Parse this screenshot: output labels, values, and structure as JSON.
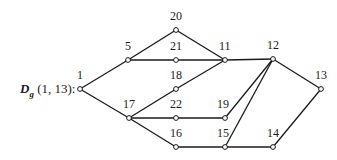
{
  "title": {
    "graph_symbol": "D",
    "subscript": "g",
    "args": "(1, 13):"
  },
  "graph": {
    "nodes": [
      {
        "id": "1",
        "x": 80,
        "y": 89,
        "lx": 77,
        "ly": 79
      },
      {
        "id": "5",
        "x": 128,
        "y": 60,
        "lx": 125,
        "ly": 50
      },
      {
        "id": "20",
        "x": 176,
        "y": 30,
        "lx": 170,
        "ly": 20
      },
      {
        "id": "21",
        "x": 176,
        "y": 60,
        "lx": 170,
        "ly": 50
      },
      {
        "id": "11",
        "x": 225,
        "y": 60,
        "lx": 219,
        "ly": 50
      },
      {
        "id": "18",
        "x": 176,
        "y": 89,
        "lx": 170,
        "ly": 79
      },
      {
        "id": "12",
        "x": 273,
        "y": 59,
        "lx": 267,
        "ly": 49
      },
      {
        "id": "13",
        "x": 321,
        "y": 89,
        "lx": 315,
        "ly": 79
      },
      {
        "id": "17",
        "x": 129,
        "y": 118,
        "lx": 123,
        "ly": 108
      },
      {
        "id": "22",
        "x": 176,
        "y": 118,
        "lx": 170,
        "ly": 108
      },
      {
        "id": "19",
        "x": 225,
        "y": 118,
        "lx": 217,
        "ly": 108
      },
      {
        "id": "16",
        "x": 176,
        "y": 147,
        "lx": 170,
        "ly": 137
      },
      {
        "id": "15",
        "x": 225,
        "y": 147,
        "lx": 217,
        "ly": 137
      },
      {
        "id": "14",
        "x": 273,
        "y": 147,
        "lx": 267,
        "ly": 137
      }
    ],
    "edges": [
      [
        "1",
        "5"
      ],
      [
        "1",
        "17"
      ],
      [
        "5",
        "20"
      ],
      [
        "5",
        "21"
      ],
      [
        "20",
        "11"
      ],
      [
        "21",
        "11"
      ],
      [
        "18",
        "11"
      ],
      [
        "17",
        "18"
      ],
      [
        "17",
        "22"
      ],
      [
        "17",
        "16"
      ],
      [
        "22",
        "19"
      ],
      [
        "16",
        "15"
      ],
      [
        "11",
        "12"
      ],
      [
        "12",
        "13"
      ],
      [
        "12",
        "19"
      ],
      [
        "12",
        "15"
      ],
      [
        "15",
        "14"
      ],
      [
        "14",
        "13"
      ]
    ]
  }
}
